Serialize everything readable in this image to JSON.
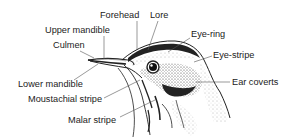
{
  "diagram": {
    "colors": {
      "ink": "#222222",
      "background": "#ffffff",
      "leader": "#555555"
    },
    "labels": [
      {
        "id": "forehead",
        "text": "Forehead",
        "x": 100,
        "y": 10
      },
      {
        "id": "lore",
        "text": "Lore",
        "x": 150,
        "y": 10
      },
      {
        "id": "upper-mandible",
        "text": "Upper mandible",
        "x": 45,
        "y": 25
      },
      {
        "id": "eye-ring",
        "text": "Eye-ring",
        "x": 191,
        "y": 29
      },
      {
        "id": "culmen",
        "text": "Culmen",
        "x": 53,
        "y": 40
      },
      {
        "id": "eye-stripe",
        "text": "Eye-stripe",
        "x": 213,
        "y": 50
      },
      {
        "id": "ear-coverts",
        "text": "Ear coverts",
        "x": 232,
        "y": 77
      },
      {
        "id": "lower-mandible",
        "text": "Lower mandible",
        "x": 18,
        "y": 79
      },
      {
        "id": "moustachial-stripe",
        "text": "Moustachial stripe",
        "x": 28,
        "y": 94
      },
      {
        "id": "malar-stripe",
        "text": "Malar stripe",
        "x": 68,
        "y": 115
      }
    ]
  }
}
